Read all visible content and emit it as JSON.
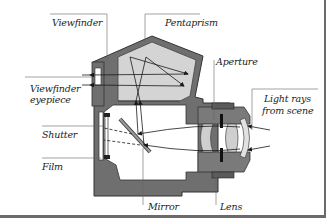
{
  "diagram": {
    "labels": {
      "viewfinder": "Viewfinder",
      "pentaprism": "Pentaprism",
      "viewfinder_eyepiece_line1": "Viewfinder",
      "viewfinder_eyepiece_line2": "eyepiece",
      "aperture": "Aperture",
      "light_rays_line1": "Light rays",
      "light_rays_line2": "from scene",
      "shutter": "Shutter",
      "film": "Film",
      "mirror": "Mirror",
      "lens": "Lens"
    },
    "colors": {
      "body_dark": "#6f6f6f",
      "body_outline": "#3a3a3a",
      "prism_fill": "#d4d4d4",
      "lens_fill": "#cfcfcf",
      "ray": "#1a1a1a",
      "leader": "#555555",
      "frame_shadow": "#6a6a6a"
    }
  }
}
